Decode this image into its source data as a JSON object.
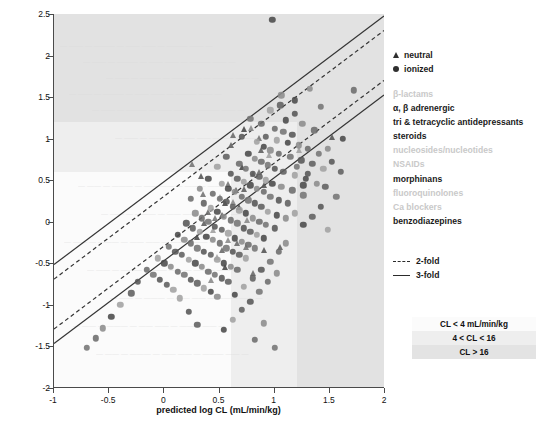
{
  "chart_data": {
    "type": "scatter",
    "title": "",
    "xlabel": "predicted log CL (mL/min/kg)",
    "ylabel": "observed log CL (mL/min/kg)",
    "xlim": [
      -1,
      2
    ],
    "ylim": [
      -2,
      2.5
    ],
    "xticks": [
      -1,
      -0.5,
      0,
      0.5,
      1,
      1.5,
      2
    ],
    "xticklabels": [
      "-1",
      "-0.5",
      "0",
      "0.5",
      "1",
      "1.5",
      "2"
    ],
    "yticks": [
      -2,
      -1.5,
      -1,
      -0.5,
      0,
      0.5,
      1,
      1.5,
      2,
      2.5
    ],
    "yticklabels": [
      "-2",
      "-1.5",
      "-1",
      "-0.5",
      "0",
      "0.5",
      "1",
      "1.5",
      "2",
      "2.5"
    ],
    "grid": false,
    "legend_position": "right-outside",
    "reference_lines": [
      {
        "name": "2-fold upper",
        "style": "dashed",
        "slope": 1,
        "intercept": 0.301
      },
      {
        "name": "2-fold lower",
        "style": "dashed",
        "slope": 1,
        "intercept": -0.301
      },
      {
        "name": "3-fold upper",
        "style": "solid",
        "slope": 1,
        "intercept": 0.477
      },
      {
        "name": "3-fold lower",
        "style": "solid",
        "slope": 1,
        "intercept": -0.477
      }
    ],
    "shading_bands": {
      "description": "Background shaded by clearance category on both axes",
      "x_breaks": [
        0.602,
        1.204
      ],
      "y_breaks": [
        0.602,
        1.204
      ],
      "categories": [
        "CL < 4 mL/min/kg",
        "4 < CL < 16",
        "CL > 16"
      ],
      "colors": [
        "#fbfbfb",
        "#eeeeee",
        "#e2e2e2"
      ]
    },
    "series": [
      {
        "name": "neutral",
        "marker": "triangle",
        "color": "#4d4d4d",
        "points": [
          [
            0.72,
            1.12
          ],
          [
            0.79,
            1.13
          ],
          [
            0.62,
            1.05
          ],
          [
            0.86,
            1.01
          ],
          [
            1.52,
            1.02
          ],
          [
            0.88,
            0.86
          ],
          [
            0.95,
            0.8
          ],
          [
            0.7,
            0.66
          ],
          [
            0.8,
            0.58
          ],
          [
            0.86,
            0.6
          ],
          [
            0.58,
            0.45
          ],
          [
            0.65,
            0.38
          ],
          [
            0.72,
            0.4
          ],
          [
            0.5,
            0.3
          ],
          [
            0.55,
            0.22
          ],
          [
            0.62,
            0.24
          ],
          [
            0.4,
            0.12
          ],
          [
            0.46,
            0.05
          ],
          [
            0.52,
            0.08
          ],
          [
            0.36,
            -0.02
          ],
          [
            0.44,
            -0.1
          ],
          [
            0.3,
            -0.18
          ],
          [
            0.58,
            -0.22
          ],
          [
            0.66,
            -0.26
          ],
          [
            0.74,
            -0.3
          ],
          [
            0.9,
            -0.34
          ],
          [
            1.05,
            -0.3
          ],
          [
            0.48,
            -0.42
          ],
          [
            0.55,
            -0.55
          ],
          [
            0.42,
            -0.7
          ],
          [
            0.8,
            -0.62
          ],
          [
            0.25,
            0.7
          ],
          [
            0.33,
            0.55
          ],
          [
            0.6,
            0.92
          ],
          [
            1.22,
            0.86
          ],
          [
            0.68,
            0.18
          ],
          [
            0.75,
            0.02
          ],
          [
            0.52,
            -0.34
          ],
          [
            0.35,
            0.34
          ],
          [
            0.9,
            0.44
          ]
        ]
      },
      {
        "name": "ionized",
        "marker": "circle",
        "color": "#555555",
        "points": [
          [
            0.98,
            2.43
          ],
          [
            1.32,
            1.6
          ],
          [
            1.72,
            1.58
          ],
          [
            1.42,
            1.38
          ],
          [
            1.18,
            1.3
          ],
          [
            1.05,
            1.4
          ],
          [
            0.96,
            1.34
          ],
          [
            1.1,
            1.22
          ],
          [
            1.25,
            1.18
          ],
          [
            1.0,
            1.12
          ],
          [
            1.08,
            1.08
          ],
          [
            1.16,
            1.05
          ],
          [
            0.92,
            1.02
          ],
          [
            1.02,
            0.98
          ],
          [
            1.12,
            0.95
          ],
          [
            1.22,
            0.92
          ],
          [
            1.3,
            0.88
          ],
          [
            1.4,
            0.82
          ],
          [
            1.52,
            0.72
          ],
          [
            1.6,
            0.6
          ],
          [
            0.84,
            0.96
          ],
          [
            0.9,
            0.9
          ],
          [
            0.96,
            0.86
          ],
          [
            1.04,
            0.82
          ],
          [
            1.14,
            0.78
          ],
          [
            1.24,
            0.74
          ],
          [
            1.34,
            0.7
          ],
          [
            1.44,
            0.64
          ],
          [
            0.76,
            0.82
          ],
          [
            0.82,
            0.76
          ],
          [
            0.88,
            0.72
          ],
          [
            0.94,
            0.68
          ],
          [
            1.0,
            0.64
          ],
          [
            1.08,
            0.6
          ],
          [
            1.18,
            0.56
          ],
          [
            1.28,
            0.52
          ],
          [
            1.38,
            0.46
          ],
          [
            0.68,
            0.7
          ],
          [
            0.74,
            0.64
          ],
          [
            0.8,
            0.58
          ],
          [
            0.86,
            0.54
          ],
          [
            0.92,
            0.5
          ],
          [
            0.98,
            0.46
          ],
          [
            1.06,
            0.42
          ],
          [
            1.16,
            0.38
          ],
          [
            1.26,
            0.32
          ],
          [
            0.6,
            0.58
          ],
          [
            0.66,
            0.52
          ],
          [
            0.72,
            0.48
          ],
          [
            0.78,
            0.44
          ],
          [
            0.84,
            0.4
          ],
          [
            0.9,
            0.36
          ],
          [
            0.96,
            0.3
          ],
          [
            1.04,
            0.26
          ],
          [
            1.12,
            0.22
          ],
          [
            0.52,
            0.46
          ],
          [
            0.58,
            0.4
          ],
          [
            0.64,
            0.36
          ],
          [
            0.7,
            0.3
          ],
          [
            0.76,
            0.26
          ],
          [
            0.82,
            0.22
          ],
          [
            0.88,
            0.18
          ],
          [
            0.94,
            0.12
          ],
          [
            1.02,
            0.08
          ],
          [
            1.1,
            0.04
          ],
          [
            0.44,
            0.34
          ],
          [
            0.5,
            0.28
          ],
          [
            0.56,
            0.24
          ],
          [
            0.62,
            0.18
          ],
          [
            0.68,
            0.14
          ],
          [
            0.74,
            0.1
          ],
          [
            0.8,
            0.04
          ],
          [
            0.86,
            0.0
          ],
          [
            0.92,
            -0.04
          ],
          [
            1.0,
            -0.08
          ],
          [
            0.36,
            0.22
          ],
          [
            0.42,
            0.16
          ],
          [
            0.48,
            0.12
          ],
          [
            0.54,
            0.06
          ],
          [
            0.6,
            0.02
          ],
          [
            0.66,
            -0.02
          ],
          [
            0.72,
            -0.08
          ],
          [
            0.78,
            -0.12
          ],
          [
            0.84,
            -0.16
          ],
          [
            0.9,
            -0.2
          ],
          [
            0.28,
            0.1
          ],
          [
            0.34,
            0.04
          ],
          [
            0.4,
            0.0
          ],
          [
            0.46,
            -0.06
          ],
          [
            0.52,
            -0.1
          ],
          [
            0.58,
            -0.14
          ],
          [
            0.64,
            -0.2
          ],
          [
            0.7,
            -0.24
          ],
          [
            0.76,
            -0.28
          ],
          [
            0.82,
            -0.32
          ],
          [
            0.2,
            -0.02
          ],
          [
            0.26,
            -0.08
          ],
          [
            0.32,
            -0.12
          ],
          [
            0.38,
            -0.18
          ],
          [
            0.44,
            -0.22
          ],
          [
            0.5,
            -0.26
          ],
          [
            0.56,
            -0.32
          ],
          [
            0.62,
            -0.36
          ],
          [
            0.68,
            -0.4
          ],
          [
            0.74,
            -0.44
          ],
          [
            0.12,
            -0.16
          ],
          [
            0.18,
            -0.22
          ],
          [
            0.24,
            -0.26
          ],
          [
            0.3,
            -0.32
          ],
          [
            0.36,
            -0.36
          ],
          [
            0.42,
            -0.4
          ],
          [
            0.48,
            -0.46
          ],
          [
            0.54,
            -0.5
          ],
          [
            0.6,
            -0.54
          ],
          [
            0.66,
            -0.58
          ],
          [
            0.04,
            -0.3
          ],
          [
            0.1,
            -0.36
          ],
          [
            0.16,
            -0.4
          ],
          [
            0.22,
            -0.46
          ],
          [
            0.28,
            -0.5
          ],
          [
            0.34,
            -0.54
          ],
          [
            0.4,
            -0.6
          ],
          [
            0.46,
            -0.64
          ],
          [
            0.52,
            -0.68
          ],
          [
            0.58,
            -0.72
          ],
          [
            -0.06,
            -0.44
          ],
          [
            0.0,
            -0.5
          ],
          [
            0.06,
            -0.54
          ],
          [
            0.12,
            -0.6
          ],
          [
            0.18,
            -0.64
          ],
          [
            0.24,
            -0.7
          ],
          [
            0.3,
            -0.74
          ],
          [
            0.36,
            -0.8
          ],
          [
            0.42,
            -0.84
          ],
          [
            0.48,
            -0.9
          ],
          [
            -0.16,
            -0.58
          ],
          [
            -0.1,
            -0.64
          ],
          [
            -0.04,
            -0.7
          ],
          [
            0.02,
            -0.76
          ],
          [
            0.08,
            -0.82
          ],
          [
            1.62,
            1.0
          ],
          [
            1.48,
            0.88
          ],
          [
            1.36,
            1.1
          ],
          [
            1.2,
            0.66
          ],
          [
            1.3,
            0.58
          ],
          [
            1.46,
            0.42
          ],
          [
            1.18,
            0.1
          ],
          [
            1.26,
            -0.04
          ],
          [
            1.1,
            -0.26
          ],
          [
            1.04,
            -0.36
          ],
          [
            0.96,
            -0.48
          ],
          [
            0.88,
            -0.58
          ],
          [
            0.8,
            -0.68
          ],
          [
            0.72,
            -0.78
          ],
          [
            0.64,
            -0.88
          ],
          [
            1.02,
            -0.62
          ],
          [
            0.94,
            -0.72
          ],
          [
            0.86,
            -0.84
          ],
          [
            0.78,
            -0.96
          ],
          [
            0.7,
            -1.06
          ],
          [
            0.62,
            -1.18
          ],
          [
            0.54,
            -1.3
          ],
          [
            0.9,
            -1.22
          ],
          [
            0.82,
            -1.42
          ],
          [
            1.0,
            -1.52
          ],
          [
            -0.24,
            -0.72
          ],
          [
            -0.3,
            -0.86
          ],
          [
            -0.4,
            -1.0
          ],
          [
            -0.48,
            -1.14
          ],
          [
            -0.56,
            -1.28
          ],
          [
            -0.62,
            -1.4
          ],
          [
            -0.7,
            -1.52
          ],
          [
            0.22,
            -1.08
          ],
          [
            0.3,
            -1.24
          ],
          [
            0.14,
            -0.92
          ],
          [
            1.18,
            1.46
          ],
          [
            1.06,
            1.52
          ],
          [
            0.88,
            1.18
          ],
          [
            0.78,
            1.24
          ],
          [
            0.7,
            1.02
          ],
          [
            0.56,
            0.78
          ],
          [
            0.48,
            0.66
          ],
          [
            0.4,
            0.52
          ],
          [
            0.32,
            0.4
          ],
          [
            0.24,
            0.28
          ],
          [
            1.56,
            0.3
          ],
          [
            1.42,
            0.18
          ],
          [
            1.34,
            0.06
          ],
          [
            1.48,
            -0.1
          ],
          [
            1.26,
            0.44
          ]
        ]
      }
    ]
  },
  "axes": {
    "x_title": "predicted log CL (mL/min/kg)",
    "y_title": "observed log CL (mL/min/kg)"
  },
  "legend": {
    "markers": [
      {
        "icon": "triangle-marker",
        "label": "neutral"
      },
      {
        "icon": "circle-marker",
        "label": "ionized"
      }
    ],
    "classes": [
      {
        "label": "β-lactams",
        "faded": true
      },
      {
        "label": "α, β adrenergic",
        "faded": false
      },
      {
        "label": "tri & tetracyclic antidepressants",
        "faded": false
      },
      {
        "label": "steroids",
        "faded": false
      },
      {
        "label": "nucleosides/nucleotides",
        "faded": true
      },
      {
        "label": "NSAIDs",
        "faded": true
      },
      {
        "label": "morphinans",
        "faded": false
      },
      {
        "label": "fluoroquinolones",
        "faded": true
      },
      {
        "label": "Ca blockers",
        "faded": true
      },
      {
        "label": "benzodiazepines",
        "faded": false
      }
    ],
    "folds": [
      {
        "style": "dashed",
        "label": "2-fold"
      },
      {
        "style": "solid",
        "label": "3-fold"
      }
    ],
    "cl_bands": [
      {
        "label": "CL < 4 mL/min/kg",
        "color": "#fbfbfb"
      },
      {
        "label": "4 < CL < 16",
        "color": "#eeeeee"
      },
      {
        "label": "CL > 16",
        "color": "#e3e3e3"
      }
    ]
  }
}
